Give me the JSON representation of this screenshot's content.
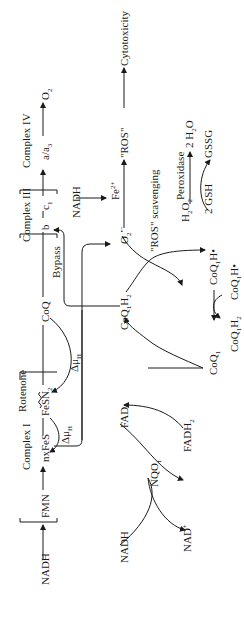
{
  "diagram": {
    "orientation": "rotated-90-ccw",
    "electron_transport_chain": {
      "nadh": "NADH",
      "fmn": "FMN",
      "complex_1": "Complex I",
      "nxfes": "nxFeS",
      "fesn2": "FeSN",
      "fesn2_sub": "2",
      "rotenone": "Rotenone",
      "delta_mu_1": "Δμ",
      "delta_mu_1_sub": "H",
      "delta_mu_2": "Δμ",
      "delta_mu_2_sub": "H",
      "coq": "CoQ",
      "bypass": "Bypass",
      "complex_3": "Complex III",
      "b": "b",
      "c1": "c",
      "c1_sub": "1",
      "complex_4": "Complex IV",
      "aa3": "a/a",
      "aa3_sub": "3",
      "o2": "O",
      "o2_sub": "2"
    },
    "nqo1_cycle": {
      "nadh": "NADH",
      "nad_plus": "NAD",
      "nad_plus_sup": "+",
      "nqo1": "NQO",
      "nqo1_sub": "1",
      "fad": "FAD",
      "fadh2": "FADH",
      "fadh2_sub": "2"
    },
    "coq1_cycle": {
      "coq1h2_top": "CoQ",
      "coq1h2_top_sub": "1",
      "coq1h2_top_tail": "H",
      "coq1h2_top_tail_sub": "2",
      "coq1": "CoQ",
      "coq1_sub": "1",
      "coq1h2_bottom": "CoQ",
      "coq1h2_bottom_sub": "1",
      "coq1h2_bottom_tail": "H",
      "coq1h2_bottom_tail_sub": "2",
      "coq1h_radical_a": "CoQ",
      "coq1h_radical_a_sub": "1",
      "coq1h_radical_a_tail": "H•",
      "coq1h_radical_b": "CoQ",
      "coq1h_radical_b_sub": "1",
      "coq1h_radical_b_tail": "H•"
    },
    "ros": {
      "superoxide": "O",
      "superoxide_sub": "2",
      "superoxide_sup": "•−",
      "nadh": "NADH",
      "fe2": "Fe",
      "fe2_sup": "2+",
      "ros": "\"ROS\"",
      "cytotoxicity": "Cytotoxicity",
      "ros_scavenging": "\"ROS\" scavenging",
      "h2o2": "H",
      "h2o2_sub1": "2",
      "h2o2_mid": "O",
      "h2o2_sub2": "2",
      "peroxidase": "Peroxidase",
      "gsh": "2 GSH",
      "gssg": "GSSG",
      "water": "2 H",
      "water_sub": "2",
      "water_tail": "O"
    }
  }
}
